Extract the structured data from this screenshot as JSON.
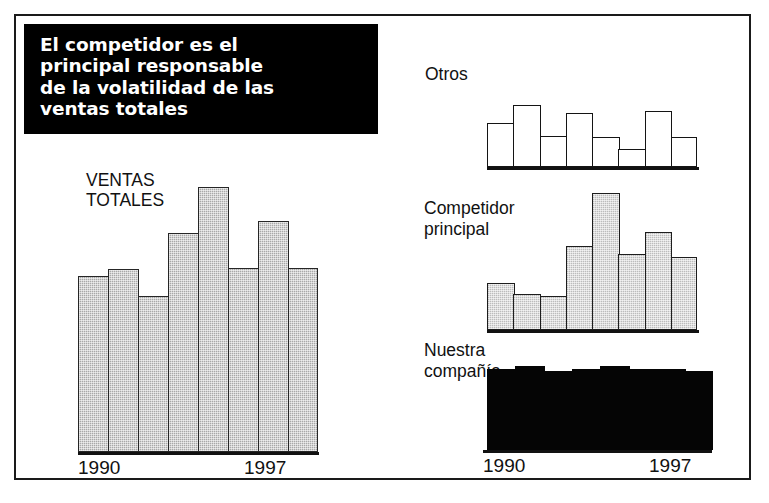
{
  "figure": {
    "callout_text": "El competidor es el\nprincipal responsable\nde la volatilidad de las\nventas totales",
    "border_color": "#1a1a1a",
    "callout_bg": "#000000",
    "callout_fg": "#ffffff"
  },
  "chart_data": [
    {
      "id": "ventas-totales",
      "type": "bar",
      "title": "VENTAS\nTOTALES",
      "xlabel": "",
      "ylabel": "",
      "grid": false,
      "legend": "none",
      "axis_ticks": [
        "1990",
        "1997"
      ],
      "categories": [
        "1990",
        "1991",
        "1992",
        "1993",
        "1994",
        "1995",
        "1996",
        "1997"
      ],
      "values": [
        176,
        183,
        156,
        219,
        265,
        184,
        231,
        184
      ],
      "ylim": [
        0,
        265
      ],
      "bar_fill": "#a8a8a8",
      "bar_stroke": "#262626"
    },
    {
      "id": "otros",
      "type": "bar",
      "title": "Otros",
      "xlabel": "",
      "ylabel": "",
      "grid": false,
      "legend": "none",
      "axis_ticks": [],
      "categories": [
        "1990",
        "1991",
        "1992",
        "1993",
        "1994",
        "1995",
        "1996",
        "1997"
      ],
      "values": [
        44,
        62,
        31,
        54,
        30,
        18,
        56,
        30
      ],
      "ylim": [
        0,
        72
      ],
      "bar_fill": "#ffffff",
      "bar_stroke": "#141414"
    },
    {
      "id": "competidor-principal",
      "type": "bar",
      "title": "Competidor\nprincipal",
      "xlabel": "",
      "ylabel": "",
      "grid": false,
      "legend": "none",
      "axis_ticks": [],
      "categories": [
        "1990",
        "1991",
        "1992",
        "1993",
        "1994",
        "1995",
        "1996",
        "1997"
      ],
      "values": [
        47,
        36,
        34,
        84,
        137,
        76,
        98,
        73
      ],
      "ylim": [
        0,
        142
      ],
      "bar_fill": "#dedede",
      "bar_stroke": "#1d1d1d"
    },
    {
      "id": "nuestra-compania",
      "type": "bar",
      "title": "Nuestra\ncompañía",
      "xlabel": "",
      "ylabel": "",
      "grid": false,
      "legend": "none",
      "axis_ticks": [
        "1990",
        "1997"
      ],
      "categories": [
        "1990",
        "1991",
        "1992",
        "1993",
        "1994",
        "1995",
        "1996",
        "1997"
      ],
      "values": [
        81,
        84,
        79,
        81,
        84,
        81,
        81,
        79
      ],
      "ylim": [
        0,
        88
      ],
      "bar_fill": "#050505",
      "bar_stroke": "#050505"
    }
  ],
  "labels": {
    "main_inner_title": "VENTAS\nTOTALES",
    "otros": "Otros",
    "competidor": "Competidor\nprincipal",
    "nuestra": "Nuestra\ncompañía",
    "main_tick_start": "1990",
    "main_tick_end": "1997",
    "nuestra_tick_start": "1990",
    "nuestra_tick_end": "1997"
  }
}
